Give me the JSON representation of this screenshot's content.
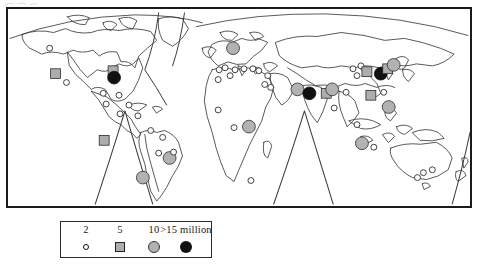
{
  "figure": {
    "kind": "world-map",
    "projection": "interrupted-equal-area"
  },
  "legend": {
    "items": [
      {
        "label": "2",
        "symbol": "small-open-circle",
        "value": 2,
        "unit": "million"
      },
      {
        "label": "5",
        "symbol": "gray-square",
        "value": 5,
        "unit": "million"
      },
      {
        "label": "10",
        "symbol": "gray-circle",
        "value": 10,
        "unit": "million"
      },
      {
        "label": ">15 million",
        "symbol": "black-circle",
        "value": 15,
        "unit": "million"
      }
    ]
  },
  "colors": {
    "frame": "#1b1b1b",
    "coastline": "#3a3a3a",
    "marker_small": "#ffffff",
    "marker_medium": "#adadad",
    "marker_large": "#b2b2b2",
    "marker_mega": "#111111",
    "background": "#ffffff"
  },
  "chart_data": {
    "type": "scatter",
    "title": "",
    "xlabel": "",
    "ylabel": "",
    "marker_classes": [
      {
        "name": "2 million",
        "shape": "open-circle",
        "fill": "#ffffff",
        "size": 6
      },
      {
        "name": "5 million",
        "shape": "square",
        "fill": "#adadad",
        "size": 10
      },
      {
        "name": "10 million",
        "shape": "circle",
        "fill": "#b2b2b2",
        "size": 13
      },
      {
        "name": ">15 million",
        "shape": "circle",
        "fill": "#111111",
        "size": 13
      }
    ],
    "markers": [
      {
        "x": 42,
        "y": 40,
        "class": "2 million"
      },
      {
        "x": 48,
        "y": 66,
        "class": "5 million"
      },
      {
        "x": 59,
        "y": 75,
        "class": "2 million"
      },
      {
        "x": 106,
        "y": 63,
        "class": "5 million"
      },
      {
        "x": 107,
        "y": 70,
        "class": ">15 million"
      },
      {
        "x": 96,
        "y": 86,
        "class": "2 million"
      },
      {
        "x": 112,
        "y": 88,
        "class": "2 million"
      },
      {
        "x": 99,
        "y": 97,
        "class": "2 million"
      },
      {
        "x": 122,
        "y": 98,
        "class": "2 million"
      },
      {
        "x": 113,
        "y": 107,
        "class": "2 million"
      },
      {
        "x": 131,
        "y": 109,
        "class": "2 million"
      },
      {
        "x": 97,
        "y": 134,
        "class": "5 million"
      },
      {
        "x": 144,
        "y": 124,
        "class": "2 million"
      },
      {
        "x": 156,
        "y": 131,
        "class": "2 million"
      },
      {
        "x": 152,
        "y": 147,
        "class": "2 million"
      },
      {
        "x": 163,
        "y": 152,
        "class": "10 million"
      },
      {
        "x": 167,
        "y": 146,
        "class": "2 million"
      },
      {
        "x": 136,
        "y": 172,
        "class": "10 million"
      },
      {
        "x": 227,
        "y": 40,
        "class": "10 million"
      },
      {
        "x": 213,
        "y": 62,
        "class": "2 million"
      },
      {
        "x": 219,
        "y": 60,
        "class": "2 million"
      },
      {
        "x": 229,
        "y": 62,
        "class": "2 million"
      },
      {
        "x": 238,
        "y": 61,
        "class": "2 million"
      },
      {
        "x": 247,
        "y": 61,
        "class": "2 million"
      },
      {
        "x": 212,
        "y": 72,
        "class": "2 million"
      },
      {
        "x": 224,
        "y": 68,
        "class": "2 million"
      },
      {
        "x": 253,
        "y": 63,
        "class": "2 million"
      },
      {
        "x": 262,
        "y": 68,
        "class": "2 million"
      },
      {
        "x": 259,
        "y": 77,
        "class": "2 million"
      },
      {
        "x": 265,
        "y": 80,
        "class": "2 million"
      },
      {
        "x": 212,
        "y": 103,
        "class": "2 million"
      },
      {
        "x": 228,
        "y": 121,
        "class": "2 million"
      },
      {
        "x": 243,
        "y": 120,
        "class": "10 million"
      },
      {
        "x": 245,
        "y": 175,
        "class": "2 million"
      },
      {
        "x": 292,
        "y": 82,
        "class": "10 million"
      },
      {
        "x": 304,
        "y": 86,
        "class": ">15 million"
      },
      {
        "x": 321,
        "y": 86,
        "class": "5 million"
      },
      {
        "x": 327,
        "y": 82,
        "class": "10 million"
      },
      {
        "x": 341,
        "y": 85,
        "class": "2 million"
      },
      {
        "x": 329,
        "y": 101,
        "class": "2 million"
      },
      {
        "x": 348,
        "y": 61,
        "class": "2 million"
      },
      {
        "x": 356,
        "y": 58,
        "class": "2 million"
      },
      {
        "x": 352,
        "y": 68,
        "class": "2 million"
      },
      {
        "x": 362,
        "y": 64,
        "class": "5 million"
      },
      {
        "x": 376,
        "y": 66,
        "class": ">15 million"
      },
      {
        "x": 383,
        "y": 61,
        "class": "5 million"
      },
      {
        "x": 389,
        "y": 57,
        "class": "10 million"
      },
      {
        "x": 366,
        "y": 88,
        "class": "5 million"
      },
      {
        "x": 379,
        "y": 85,
        "class": "2 million"
      },
      {
        "x": 384,
        "y": 100,
        "class": "10 million"
      },
      {
        "x": 352,
        "y": 118,
        "class": "2 million"
      },
      {
        "x": 357,
        "y": 137,
        "class": "10 million"
      },
      {
        "x": 369,
        "y": 141,
        "class": "2 million"
      },
      {
        "x": 419,
        "y": 167,
        "class": "2 million"
      },
      {
        "x": 428,
        "y": 164,
        "class": "2 million"
      },
      {
        "x": 413,
        "y": 172,
        "class": "2 million"
      }
    ]
  }
}
